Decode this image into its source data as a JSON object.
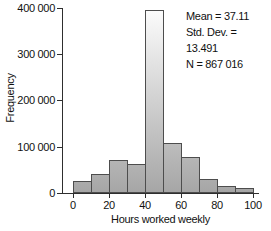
{
  "chart": {
    "x_axis": {
      "label": "Hours worked weekly",
      "ticks": [
        "0",
        "20",
        "40",
        "60",
        "80",
        "100"
      ]
    },
    "y_axis": {
      "label": "Frequency",
      "ticks": [
        "0",
        "100 000",
        "200 000",
        "300 000",
        "400 000"
      ]
    },
    "stats": {
      "mean": "Mean = 37.11",
      "std_dev": "Std. Dev. = 13.491",
      "n": "N = 867 016"
    }
  },
  "chart_data": {
    "type": "bar",
    "title": "",
    "xlabel": "Hours worked weekly",
    "ylabel": "Frequency",
    "bin_edges": [
      0,
      10,
      20,
      30,
      40,
      50,
      60,
      70,
      80,
      90,
      100
    ],
    "categories": [
      "0-10",
      "10-20",
      "20-30",
      "30-40",
      "40-50",
      "50-60",
      "60-70",
      "70-80",
      "80-90",
      "90-100"
    ],
    "values": [
      25000,
      42000,
      71000,
      62000,
      396000,
      108000,
      78000,
      30000,
      16000,
      10000
    ],
    "xlim": [
      0,
      100
    ],
    "ylim": [
      0,
      400000
    ],
    "grid": false,
    "legend": "none",
    "annotations": [
      "Mean = 37.11",
      "Std. Dev. = 13.491",
      "N = 867 016"
    ],
    "bar_fill_bottom": "#a6a6a6",
    "bar_fill_top": "#fdfdfd",
    "bar_border": "#4d4d4d",
    "axis_color": "#2e2e2e",
    "text_color": "#111111"
  }
}
